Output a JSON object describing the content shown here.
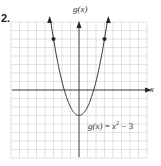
{
  "problem": {
    "number": "2."
  },
  "axes": {
    "ylabel": "g(x)",
    "xlabel": "x"
  },
  "equation": {
    "lhs": "g(x)",
    "eq": " = ",
    "var": "x",
    "exp": "2",
    "rest": " − 3"
  },
  "colors": {
    "curve": "#333333",
    "grid": "#cfcfcf",
    "axis": "#333333"
  },
  "chart_data": {
    "type": "line",
    "title": "",
    "function": "g(x) = x^2 - 3",
    "xlabel": "x",
    "ylabel": "g(x)",
    "xlim": [
      -8,
      8
    ],
    "ylim": [
      -8,
      8
    ],
    "grid": true,
    "series": [
      {
        "name": "g(x) = x^2 - 3",
        "x": [
          -3.4,
          -3,
          -2,
          -1,
          0,
          1,
          2,
          3,
          3.4
        ],
        "y": [
          8.56,
          6,
          1,
          -2,
          -3,
          -2,
          1,
          6,
          8.56
        ]
      }
    ],
    "marked_points": [
      [
        -3,
        6
      ],
      [
        3,
        6
      ]
    ],
    "vertex": [
      0,
      -3
    ],
    "annotations": [
      "g(x) = x^2 − 3"
    ]
  }
}
